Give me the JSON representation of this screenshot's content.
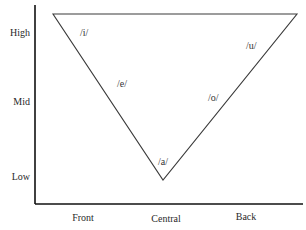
{
  "diagram": {
    "type": "vowel-triangle",
    "y_axis": {
      "labels": [
        "High",
        "Mid",
        "Low"
      ]
    },
    "x_axis": {
      "labels": [
        "Front",
        "Central",
        "Back"
      ]
    },
    "vowels": [
      {
        "symbol": "/i/",
        "position": "high-front"
      },
      {
        "symbol": "/e/",
        "position": "mid-front"
      },
      {
        "symbol": "/a/",
        "position": "low-central"
      },
      {
        "symbol": "/o/",
        "position": "mid-back"
      },
      {
        "symbol": "/u/",
        "position": "high-back"
      }
    ],
    "colors": {
      "line": "#333333",
      "axis": "#111111",
      "background": "#ffffff"
    }
  }
}
